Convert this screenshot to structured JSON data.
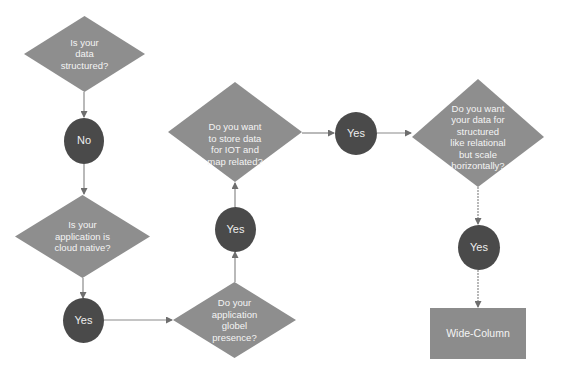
{
  "colors": {
    "diamond_fill": "#8e8e8e",
    "circle_fill": "#4a4a4a",
    "rect_fill": "#8c8c8c",
    "connector": "#7a7a7a",
    "label_text": "#f4f4f4",
    "background": "#ffffff"
  },
  "nodes": {
    "q_structured": {
      "type": "decision",
      "label": "Is your\ndata\nstructured?"
    },
    "a_no": {
      "type": "answer",
      "label": "No"
    },
    "q_cloud_native": {
      "type": "decision",
      "label": "Is your\napplication is\ncloud native?"
    },
    "a_yes_cloud": {
      "type": "answer",
      "label": "Yes"
    },
    "q_global": {
      "type": "decision",
      "label": "Do your\napplication\nglobel\npresence?"
    },
    "a_yes_global": {
      "type": "answer",
      "label": "Yes"
    },
    "q_iot": {
      "type": "decision",
      "label": "Do you want\nto store data\nfor IOT and\nmap related?"
    },
    "a_yes_iot": {
      "type": "answer",
      "label": "Yes"
    },
    "q_relational": {
      "type": "decision",
      "label": "Do you want\nyour data for\nstructured\nlike relational\nbut scale\nhorizontally?"
    },
    "a_yes_relational": {
      "type": "answer",
      "label": "Yes"
    },
    "result_wide_column": {
      "type": "result",
      "label": "Wide-Column"
    }
  },
  "edges": [
    {
      "from": "q_structured",
      "to": "a_no"
    },
    {
      "from": "a_no",
      "to": "q_cloud_native"
    },
    {
      "from": "q_cloud_native",
      "to": "a_yes_cloud"
    },
    {
      "from": "a_yes_cloud",
      "to": "q_global"
    },
    {
      "from": "q_global",
      "to": "a_yes_global"
    },
    {
      "from": "a_yes_global",
      "to": "q_iot"
    },
    {
      "from": "q_iot",
      "to": "a_yes_iot"
    },
    {
      "from": "a_yes_iot",
      "to": "q_relational"
    },
    {
      "from": "q_relational",
      "to": "a_yes_relational"
    },
    {
      "from": "a_yes_relational",
      "to": "result_wide_column"
    }
  ]
}
